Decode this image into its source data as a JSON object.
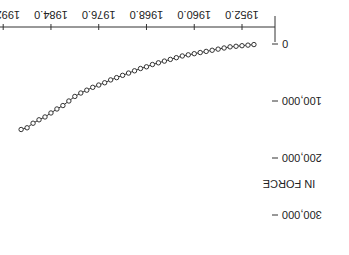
{
  "chart_data": {
    "type": "line",
    "title": "",
    "xlabel": "",
    "ylabel": "IN FORCE",
    "x_ticks": [
      "1952.0",
      "1960.0",
      "1968.0",
      "1976.0",
      "1984.0",
      "1992.0"
    ],
    "y_ticks": [
      "0",
      "100,000",
      "200,000",
      "300,000"
    ],
    "xlim": [
      1950,
      1994
    ],
    "ylim": [
      0,
      320000
    ],
    "grid": false,
    "marker": "circle",
    "orientation_note": "rendered rotated 180 degrees",
    "x": [
      1950,
      1951,
      1952,
      1953,
      1954,
      1955,
      1956,
      1957,
      1958,
      1959,
      1960,
      1961,
      1962,
      1963,
      1964,
      1965,
      1966,
      1967,
      1968,
      1969,
      1970,
      1971,
      1972,
      1973,
      1974,
      1975,
      1976,
      1977,
      1978,
      1979,
      1980,
      1981,
      1982,
      1983,
      1984,
      1985,
      1986,
      1987,
      1988,
      1989
    ],
    "values": [
      1000,
      2000,
      3000,
      4000,
      5000,
      7000,
      9000,
      11000,
      13000,
      15000,
      17000,
      19000,
      21000,
      24000,
      27000,
      30000,
      33000,
      36000,
      40000,
      43000,
      47000,
      51000,
      55000,
      59000,
      63000,
      68000,
      72000,
      76000,
      81000,
      86000,
      92000,
      100000,
      108000,
      114000,
      121000,
      128000,
      133000,
      139000,
      147000,
      150000
    ]
  }
}
